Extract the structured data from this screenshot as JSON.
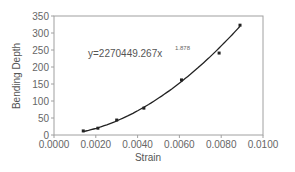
{
  "chart_data": {
    "type": "scatter",
    "title": "",
    "xlabel": "Strain",
    "ylabel": "Bending Depth",
    "xlim": [
      0.0,
      0.01
    ],
    "ylim": [
      0,
      350
    ],
    "x_ticks": [
      "0.0000",
      "0.0020",
      "0.0040",
      "0.0060",
      "0.0080",
      "0.0100"
    ],
    "y_ticks": [
      "0",
      "50",
      "100",
      "150",
      "200",
      "250",
      "300",
      "350"
    ],
    "grid": false,
    "legend": null,
    "series": [
      {
        "name": "Bending Depth",
        "marker": "square",
        "x": [
          0.0014,
          0.0021,
          0.003,
          0.0043,
          0.0061,
          0.0079,
          0.0089
        ],
        "y": [
          12,
          20,
          44,
          79,
          162,
          241,
          323
        ]
      }
    ],
    "trendline": {
      "type": "power",
      "coefficient": 2270449.267,
      "exponent": 1.878,
      "label": "y=2270449.267x",
      "label_exponent": "1.878"
    },
    "annotations": [
      "y=2270449.267x^1.878"
    ]
  },
  "colors": {
    "axis": "#a0a0a0",
    "plot_border": "#a0a0a0",
    "series": "#222222",
    "text": "#666666"
  }
}
